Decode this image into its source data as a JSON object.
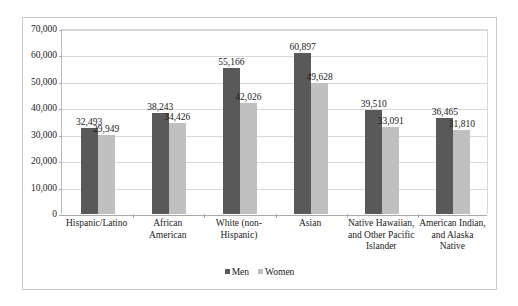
{
  "chart_data": {
    "type": "bar",
    "title": "",
    "subtitle": "",
    "xlabel": "",
    "ylabel": "",
    "ylim": [
      0,
      70000
    ],
    "ytick_values": [
      0,
      10000,
      20000,
      30000,
      40000,
      50000,
      60000,
      70000
    ],
    "ytick_labels": [
      "0",
      "10,000",
      "20,000",
      "30,000",
      "40,000",
      "50,000",
      "60,000",
      "70,000"
    ],
    "grid": true,
    "legend_position": "bottom",
    "categories": [
      "Hispanic/Latino",
      "African American",
      "White (non-Hispanic)",
      "Asian",
      "Native Hawaiian, and Other Pacific Islander",
      "American Indian, and Alaska Native"
    ],
    "category_label_lines": [
      [
        "Hispanic/Latino"
      ],
      [
        "African",
        "American"
      ],
      [
        "White (non-",
        "Hispanic)"
      ],
      [
        "Asian"
      ],
      [
        "Native Hawaiian,",
        "and Other Pacific",
        "Islander"
      ],
      [
        "American Indian,",
        "and Alaska",
        "Native"
      ]
    ],
    "series": [
      {
        "name": "Men",
        "color": "#595959",
        "values": [
          32493,
          38243,
          55166,
          60897,
          39510,
          36465
        ],
        "value_labels": [
          "32,493",
          "38,243",
          "55,166",
          "60,897",
          "39,510",
          "36,465"
        ]
      },
      {
        "name": "Women",
        "color": "#c0c0c0",
        "values": [
          29949,
          34426,
          42026,
          49628,
          33091,
          31810
        ],
        "value_labels": [
          "29,949",
          "34,426",
          "42,026",
          "49,628",
          "33,091",
          "31,810"
        ]
      }
    ]
  },
  "legend": {
    "entries": [
      {
        "label": "Men",
        "color": "#595959"
      },
      {
        "label": "Women",
        "color": "#c0c0c0"
      }
    ]
  }
}
